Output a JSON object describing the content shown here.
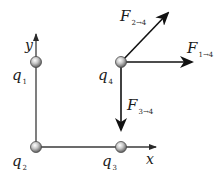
{
  "diagram": {
    "type": "force-vector-diagram",
    "axes": {
      "x_label": "x",
      "y_label": "y"
    },
    "charges": [
      {
        "id": "q1",
        "symbol": "q",
        "subscript": "1",
        "position": "top-left"
      },
      {
        "id": "q2",
        "symbol": "q",
        "subscript": "2",
        "position": "origin"
      },
      {
        "id": "q3",
        "symbol": "q",
        "subscript": "3",
        "position": "bottom-right"
      },
      {
        "id": "q4",
        "symbol": "q",
        "subscript": "4",
        "position": "top-right"
      }
    ],
    "forces": [
      {
        "id": "F2to4",
        "symbol": "F",
        "subscript": "2→4",
        "direction": "up-right (diagonal)"
      },
      {
        "id": "F1to4",
        "symbol": "F",
        "subscript": "1→4",
        "direction": "right (+x)"
      },
      {
        "id": "F3to4",
        "symbol": "F",
        "subscript": "3→4",
        "direction": "down (−y)"
      }
    ],
    "colors": {
      "line": "#3a3a3a",
      "arrow": "#111111",
      "sphere_light": "#f2f2f2",
      "sphere_dark": "#6a6a6a"
    }
  }
}
